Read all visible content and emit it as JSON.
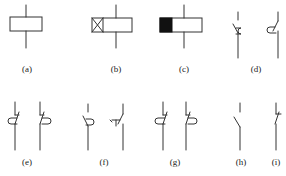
{
  "figure": {
    "stroke_color": "#333333",
    "fill_color": "#111111",
    "panels": [
      {
        "id": "a",
        "label": "(a)",
        "symbol": "relay-coil"
      },
      {
        "id": "b",
        "label": "(b)",
        "symbol": "delay-release-coil"
      },
      {
        "id": "c",
        "label": "(c)",
        "symbol": "delay-operate-coil"
      },
      {
        "id": "d",
        "label": "(d)",
        "symbol": "delay-closing-no-contact-pair"
      },
      {
        "id": "e",
        "label": "(e)",
        "symbol": "delay-opening-nc-contact-pair"
      },
      {
        "id": "f",
        "label": "(f)",
        "symbol": "delay-opening-no-contact-pair"
      },
      {
        "id": "g",
        "label": "(g)",
        "symbol": "delay-closing-nc-contact-pair"
      },
      {
        "id": "h",
        "label": "(h)",
        "symbol": "normally-open-contact"
      },
      {
        "id": "i",
        "label": "(i)",
        "symbol": "normally-closed-contact"
      }
    ]
  }
}
